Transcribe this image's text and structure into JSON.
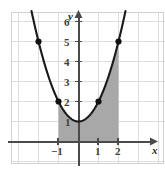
{
  "figure": {
    "title": "",
    "background_color": "#ffffff",
    "grid_color": "#d9d9d9",
    "axis_color": "#4a4a4a",
    "curve_color": "#1a1a1a",
    "shade_color": "#a8a8a8",
    "point_color": "#111111",
    "width": 165,
    "height": 173
  },
  "axes": {
    "x_axis_name": "x",
    "y_axis_name": "y",
    "x_tick_labels": [
      "−1",
      "1",
      "2"
    ],
    "y_tick_labels": [
      "1",
      "2",
      "3",
      "4",
      "5",
      "6"
    ]
  },
  "chart_data": {
    "type": "line",
    "title": "",
    "subtitle": "",
    "xlabel": "x",
    "ylabel": "y",
    "xlim": [
      -3.35,
      3.9
    ],
    "ylim": [
      -0.6,
      7.4
    ],
    "grid": true,
    "legend": "none",
    "grid_spacing": 1,
    "series": [
      {
        "name": "parabola",
        "equation": "y = x^2 + 1",
        "kind": "curve",
        "x": [
          -2.35,
          -2.0,
          -1.5,
          -1.0,
          -0.5,
          0.0,
          0.5,
          1.0,
          1.5,
          2.0,
          2.35
        ],
        "y": [
          6.52,
          5.0,
          3.25,
          2.0,
          1.25,
          1.0,
          1.25,
          2.0,
          3.25,
          5.0,
          6.52
        ]
      },
      {
        "name": "marked-points",
        "kind": "scatter",
        "x": [
          -2,
          -1,
          1,
          2
        ],
        "y": [
          5,
          2,
          2,
          5
        ],
        "labels": [
          "(−2, 5)",
          "(−1, 2)",
          "(1, 2)",
          "(2, 5)"
        ]
      }
    ],
    "shaded_region": {
      "name": "area-under-curve",
      "x_from": -1,
      "x_to": 2,
      "y_from": 0,
      "upper_bound": "y = x^2 + 1",
      "lower_bound": "y = 0",
      "fill": "#a8a8a8"
    },
    "x_ticks": [
      -1,
      1,
      2
    ],
    "y_ticks": [
      1,
      2,
      3,
      4,
      5,
      6
    ],
    "annotations": []
  }
}
